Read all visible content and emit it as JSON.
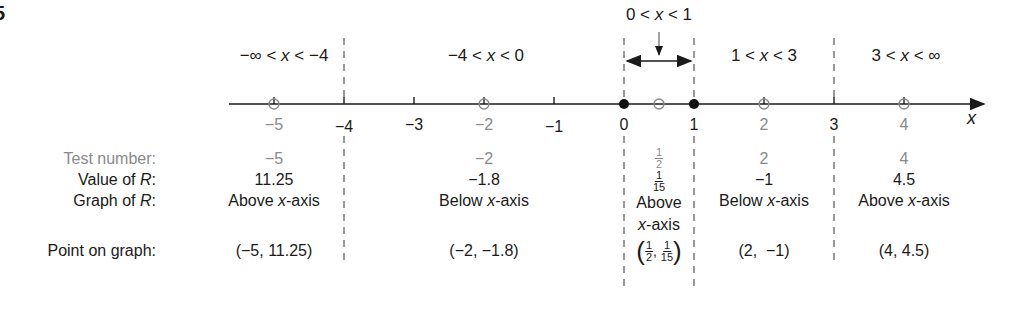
{
  "figure_number": "5",
  "axis": {
    "variable": "x",
    "ticks": [
      {
        "value": -5,
        "label": "−5",
        "style": "gray",
        "marker": "open-circle"
      },
      {
        "value": -4,
        "label": "−4",
        "style": "black",
        "marker": "tick"
      },
      {
        "value": -3,
        "label": "−3",
        "style": "black",
        "marker": "tick"
      },
      {
        "value": -2,
        "label": "−2",
        "style": "gray",
        "marker": "open-circle"
      },
      {
        "value": -1,
        "label": "−1",
        "style": "black",
        "marker": "tick"
      },
      {
        "value": 0,
        "label": "0",
        "style": "black",
        "marker": "filled-dot"
      },
      {
        "value": 0.5,
        "label": "",
        "style": "gray",
        "marker": "open-circle"
      },
      {
        "value": 1,
        "label": "1",
        "style": "black",
        "marker": "filled-dot"
      },
      {
        "value": 2,
        "label": "2",
        "style": "gray",
        "marker": "open-circle"
      },
      {
        "value": 3,
        "label": "3",
        "style": "black",
        "marker": "tick"
      },
      {
        "value": 4,
        "label": "4",
        "style": "gray",
        "marker": "open-circle"
      }
    ],
    "dividers": [
      -4,
      0,
      1,
      3
    ]
  },
  "regions": [
    {
      "label_pre": "−∞ < ",
      "var": "x",
      "label_post": " < −4"
    },
    {
      "label_pre": "−4 < ",
      "var": "x",
      "label_post": " < 0"
    },
    {
      "label_pre": "0 < ",
      "var": "x",
      "label_post": " < 1"
    },
    {
      "label_pre": "1 < ",
      "var": "x",
      "label_post": " < 3"
    },
    {
      "label_pre": "3 < ",
      "var": "x",
      "label_post": " < ∞"
    }
  ],
  "row_labels": {
    "test_number": "Test number:",
    "value_pre": "Value of ",
    "value_var": "R",
    "value_post": ":",
    "graph_pre": "Graph of ",
    "graph_var": "R",
    "graph_post": ":",
    "point": "Point on graph:"
  },
  "table": {
    "test_numbers": [
      "−5",
      "−2",
      {
        "num": "1",
        "den": "2"
      },
      "2",
      "4"
    ],
    "values_of_R": [
      "11.25",
      "−1.8",
      {
        "num": "1",
        "den": "15"
      },
      "−1",
      "4.5"
    ],
    "graph_of_R": [
      {
        "pre": "Above ",
        "var": "x",
        "post": "-axis"
      },
      {
        "pre": "Below ",
        "var": "x",
        "post": "-axis"
      },
      {
        "line1": "Above",
        "var": "x",
        "post": "-axis"
      },
      {
        "pre": "Below ",
        "var": "x",
        "post": "-axis"
      },
      {
        "pre": "Above ",
        "var": "x",
        "post": "-axis"
      }
    ],
    "points": [
      "(−5, 11.25)",
      "(−2, −1.8)",
      {
        "x_num": "1",
        "x_den": "2",
        "y_num": "1",
        "y_den": "15"
      },
      "(2,  −1)",
      "(4, 4.5)"
    ]
  },
  "colors": {
    "ink": "#1a1a1a",
    "gray": "#8a8a8a",
    "dash": "#555555"
  }
}
